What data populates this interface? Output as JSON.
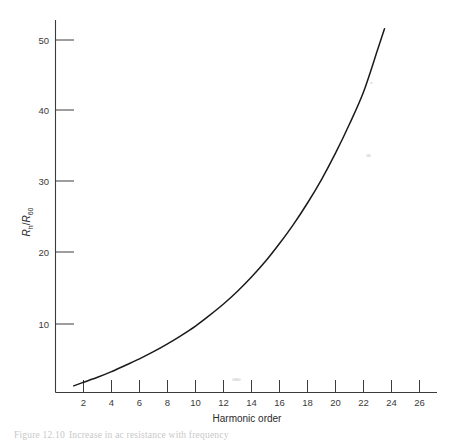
{
  "figure": {
    "caption_label": "Figure  12.10",
    "caption_text": "Increase in ac resistance with frequency",
    "background_color": "#ffffff",
    "curve_color": "#1a1a1a",
    "axis_color": "#3c3c3c"
  },
  "chart_data": {
    "type": "line",
    "title": "",
    "xlabel": "Harmonic order",
    "ylabel": "Rh/R60",
    "ylabel_parts": {
      "numerator": "R",
      "numerator_sub": "h",
      "slash": "/",
      "denominator": "R",
      "denominator_sub": "60"
    },
    "xlim": [
      0,
      27
    ],
    "ylim": [
      0,
      55
    ],
    "xticks": [
      2,
      4,
      6,
      8,
      10,
      12,
      14,
      16,
      18,
      20,
      22,
      24,
      26
    ],
    "xtick_labels": [
      "2",
      "4",
      "6",
      "8",
      "10",
      "12",
      "14",
      "16",
      "18",
      "20",
      "22",
      "24",
      "26"
    ],
    "yticks": [
      10,
      20,
      30,
      40,
      50
    ],
    "ytick_labels": [
      "10",
      "20",
      "30",
      "40",
      "50"
    ],
    "grid": false,
    "legend": false,
    "series": [
      {
        "name": "Rh/R60",
        "x": [
          1.3,
          2,
          3,
          4,
          5,
          6,
          7,
          8,
          9,
          10,
          11,
          12,
          13,
          14,
          15,
          16,
          17,
          18,
          19,
          20,
          21,
          22,
          23,
          23.5
        ],
        "y": [
          1.4,
          1.9,
          2.6,
          3.4,
          4.3,
          5.2,
          6.2,
          7.3,
          8.5,
          9.8,
          11.3,
          12.9,
          14.7,
          16.7,
          18.9,
          21.4,
          24.1,
          27.1,
          30.4,
          34.1,
          38.2,
          42.7,
          48.6,
          51.6
        ]
      }
    ]
  }
}
